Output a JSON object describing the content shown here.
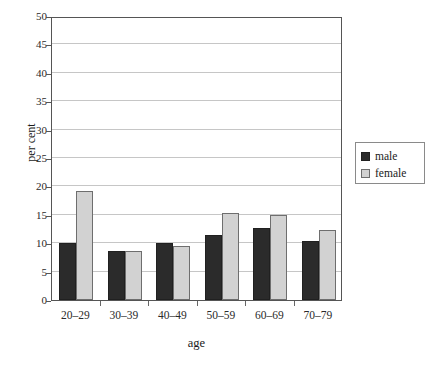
{
  "chart_data": {
    "type": "bar",
    "title": "",
    "xlabel": "age",
    "ylabel": "per cent",
    "categories": [
      "20–29",
      "30–39",
      "40–49",
      "50–59",
      "60–69",
      "70–79"
    ],
    "series": [
      {
        "name": "male",
        "color": "#2b2b2b",
        "values": [
          10.0,
          8.7,
          10.1,
          11.5,
          12.6,
          10.4
        ]
      },
      {
        "name": "female",
        "color": "#d2d2d2",
        "values": [
          19.2,
          8.6,
          9.5,
          15.4,
          15.0,
          12.4
        ]
      }
    ],
    "ylim": [
      0,
      50
    ],
    "ytick_step": 5,
    "yticks": [
      0,
      5,
      10,
      15,
      20,
      25,
      30,
      35,
      40,
      45,
      50
    ],
    "ytick_labels": [
      "0",
      "5",
      "10",
      "15",
      "20",
      "25",
      "30",
      "35",
      "40",
      "45",
      "50"
    ],
    "grid": "horizontal",
    "legend_position": "right",
    "legend_entries": [
      "male",
      "female"
    ],
    "gridline_color": "#c6c6c6",
    "frame_color": "#555555",
    "background": "#ffffff"
  }
}
